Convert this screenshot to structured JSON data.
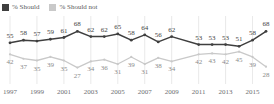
{
  "legend": {
    "items": [
      {
        "label": "% Should",
        "color": "#3f3f3f",
        "name": "legend-should"
      },
      {
        "label": "% Should not",
        "color": "#c9c9c9",
        "name": "legend-should-not"
      }
    ]
  },
  "axis": {
    "tick_labels": [
      "1997",
      "1999",
      "2001",
      "2003",
      "2005",
      "2007",
      "2009",
      "2011",
      "2013",
      "2015"
    ],
    "tick_years": [
      1997,
      1999,
      2001,
      2003,
      2005,
      2007,
      2009,
      2011,
      2013,
      2015
    ]
  },
  "chart_data": {
    "type": "line",
    "title": "",
    "subtitle": "",
    "xlabel": "",
    "ylabel": "",
    "ylim": [
      0,
      100
    ],
    "xlim": [
      1997,
      2016
    ],
    "grid": "vertical-only",
    "legend_position": "top-left",
    "x": [
      1997,
      1998,
      1999,
      2000,
      2001,
      2002,
      2003,
      2004,
      2005,
      2006,
      2007,
      2008,
      2009,
      2011,
      2012,
      2013,
      2014,
      2015,
      2016
    ],
    "categories": [
      "1997",
      "1998",
      "1999",
      "2000",
      "2001",
      "2002",
      "2003",
      "2004",
      "2005",
      "2006",
      "2007",
      "2008",
      "2009",
      "2011",
      "2012",
      "2013",
      "2014",
      "2015",
      "2016"
    ],
    "series": [
      {
        "name": "% Should",
        "color": "#3f3f3f",
        "values": [
          55,
          58,
          57,
          59,
          61,
          68,
          62,
          62,
          65,
          58,
          64,
          56,
          62,
          53,
          53,
          53,
          51,
          58,
          68
        ]
      },
      {
        "name": "% Should not",
        "color": "#c9c9c9",
        "values": [
          42,
          37,
          35,
          39,
          35,
          27,
          34,
          36,
          31,
          39,
          31,
          38,
          34,
          42,
          43,
          42,
          45,
          39,
          28
        ]
      }
    ]
  },
  "colors": {
    "should": "#3f3f3f",
    "should_not": "#c9c9c9",
    "should_label": "#3f3f3f",
    "should_not_label": "#8a8a8a",
    "gridline": "#e3e3e3",
    "background": "#ffffff",
    "tick_text": "#6d6e71"
  }
}
